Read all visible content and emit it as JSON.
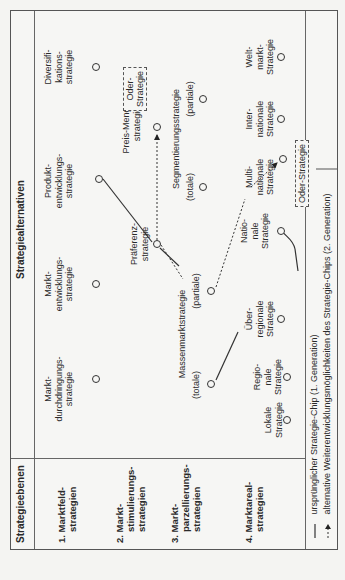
{
  "header": {
    "levels_title": "Strategieebenen",
    "alternatives_title": "Strategiealternativen"
  },
  "levels": [
    {
      "num": "1. Markt",
      "line1": "1. Marktfeld-",
      "line2": "strategien"
    },
    {
      "line1": "2. Markt-",
      "line2": "stimulierungs-",
      "line3": "strategien"
    },
    {
      "line1": "3. Markt-",
      "line2": "parzellierungs-",
      "line3": "strategien"
    },
    {
      "line1": "4. Marktareal-",
      "line2": "strategien"
    }
  ],
  "row1": [
    {
      "l1": "Markt-",
      "l2": "durchdringungs-",
      "l3": "strategie"
    },
    {
      "l1": "Markt-",
      "l2": "entwicklungs-",
      "l3": "strategie"
    },
    {
      "l1": "Produkt-",
      "l2": "entwicklungs-",
      "l3": "strategie"
    },
    {
      "l1": "Diversifi-",
      "l2": "kations-",
      "l3": "strategie"
    }
  ],
  "row2": [
    {
      "l1": "Präferenz-",
      "l2": "strategie"
    },
    {
      "l1": "Preis-Mengen-",
      "l2": "strategie"
    }
  ],
  "row3": {
    "massenmarkt": "Massenmarktstrategie",
    "segmentierung": "Segmentierungsstrategie",
    "totale": "(totale)",
    "partiale": "(partiale)"
  },
  "row4": [
    {
      "l1": "Lokale",
      "l2": "Strategie"
    },
    {
      "l1": "Regio-",
      "l2": "nale",
      "l3": "Strategie"
    },
    {
      "l1": "Über-",
      "l2": "regionale",
      "l3": "Strategie"
    },
    {
      "l1": "Natio-",
      "l2": "nale",
      "l3": "Strategie"
    },
    {
      "l1": "Multi-",
      "l2": "nationale",
      "l3": "Strategie"
    },
    {
      "l1": "Inter-",
      "l2": "nationale",
      "l3": "Strategie"
    },
    {
      "l1": "Welt-",
      "l2": "markt-",
      "l3": "Strategie"
    }
  ],
  "oder_boxes": {
    "top_l1": "Oder-",
    "top_l2": "Strategie",
    "bottom": "Oder-Strategie"
  },
  "legend": {
    "solid": "ursprünglicher Strategie-Chip (1. Generation)",
    "dashed": "alternative Weiterentwicklungsmöglichkeiten des Strategie-Chips (2. Generation)"
  }
}
